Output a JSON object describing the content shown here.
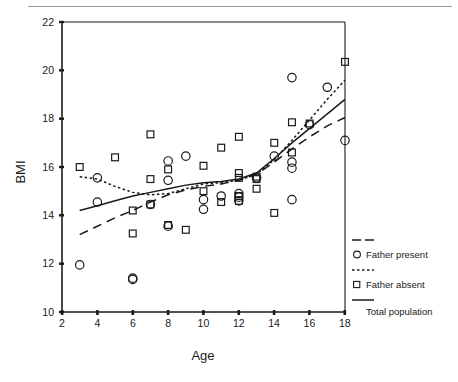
{
  "chart_data": {
    "type": "scatter",
    "title": "",
    "xlabel": "Age",
    "ylabel": "BMI",
    "xlim": [
      2,
      18
    ],
    "ylim": [
      10,
      22
    ],
    "xticks": [
      2,
      4,
      6,
      8,
      10,
      12,
      14,
      16,
      18
    ],
    "yticks": [
      10,
      12,
      14,
      16,
      18,
      20,
      22
    ],
    "grid": false,
    "legend_position": "right",
    "legend": [
      {
        "label": "Father present",
        "marker": "circle",
        "line": "dashed"
      },
      {
        "label": "Father absent",
        "marker": "square",
        "line": "dotted"
      },
      {
        "label": "Total population",
        "marker": "none",
        "line": "solid"
      }
    ],
    "series": [
      {
        "name": "Father present",
        "marker": "circle",
        "points": [
          [
            3,
            11.95
          ],
          [
            4,
            15.55
          ],
          [
            4,
            14.55
          ],
          [
            6,
            11.35
          ],
          [
            7,
            14.45
          ],
          [
            8,
            16.25
          ],
          [
            8,
            15.45
          ],
          [
            9,
            16.45
          ],
          [
            10,
            14.65
          ],
          [
            10,
            14.25
          ],
          [
            11,
            14.8
          ],
          [
            12,
            14.9
          ],
          [
            12,
            14.75
          ],
          [
            12,
            14.6
          ],
          [
            13,
            15.55
          ],
          [
            14,
            16.45
          ],
          [
            15,
            19.7
          ],
          [
            15,
            16.2
          ],
          [
            15,
            15.95
          ],
          [
            15,
            14.65
          ],
          [
            16,
            17.75
          ],
          [
            17,
            19.3
          ],
          [
            18,
            17.1
          ],
          [
            8,
            13.55
          ],
          [
            6,
            11.4
          ]
        ]
      },
      {
        "name": "Father absent",
        "marker": "square",
        "points": [
          [
            3,
            16.0
          ],
          [
            5,
            16.4
          ],
          [
            6,
            14.2
          ],
          [
            6,
            13.25
          ],
          [
            7,
            17.35
          ],
          [
            7,
            15.5
          ],
          [
            7,
            14.45
          ],
          [
            8,
            15.9
          ],
          [
            8,
            13.6
          ],
          [
            9,
            13.4
          ],
          [
            10,
            16.05
          ],
          [
            10,
            15.0
          ],
          [
            11,
            16.8
          ],
          [
            11,
            14.55
          ],
          [
            12,
            17.25
          ],
          [
            12,
            15.75
          ],
          [
            12,
            15.55
          ],
          [
            12,
            14.8
          ],
          [
            12,
            14.6
          ],
          [
            13,
            15.6
          ],
          [
            13,
            15.5
          ],
          [
            13,
            15.1
          ],
          [
            14,
            17.0
          ],
          [
            14,
            14.1
          ],
          [
            15,
            17.85
          ],
          [
            15,
            16.6
          ],
          [
            16,
            17.8
          ],
          [
            18,
            20.35
          ]
        ]
      }
    ],
    "fit_lines": [
      {
        "name": "Father present",
        "style": "dashed",
        "points": [
          [
            3,
            13.2
          ],
          [
            4,
            13.55
          ],
          [
            5,
            13.9
          ],
          [
            6,
            14.2
          ],
          [
            7,
            14.55
          ],
          [
            8,
            14.85
          ],
          [
            9,
            15.05
          ],
          [
            10,
            15.2
          ],
          [
            11,
            15.3
          ],
          [
            12,
            15.45
          ],
          [
            13,
            15.7
          ],
          [
            14,
            16.2
          ],
          [
            15,
            16.75
          ],
          [
            16,
            17.25
          ],
          [
            17,
            17.7
          ],
          [
            18,
            18.05
          ]
        ]
      },
      {
        "name": "Father absent",
        "style": "dotted",
        "points": [
          [
            3,
            15.6
          ],
          [
            4,
            15.5
          ],
          [
            5,
            15.2
          ],
          [
            6,
            14.95
          ],
          [
            7,
            14.85
          ],
          [
            8,
            14.9
          ],
          [
            9,
            15.1
          ],
          [
            10,
            15.3
          ],
          [
            11,
            15.35
          ],
          [
            12,
            15.45
          ],
          [
            13,
            15.7
          ],
          [
            14,
            16.3
          ],
          [
            15,
            17.1
          ],
          [
            16,
            17.95
          ],
          [
            17,
            18.8
          ],
          [
            18,
            19.6
          ]
        ]
      },
      {
        "name": "Total population",
        "style": "solid",
        "points": [
          [
            3,
            14.2
          ],
          [
            4,
            14.4
          ],
          [
            5,
            14.6
          ],
          [
            6,
            14.8
          ],
          [
            7,
            14.95
          ],
          [
            8,
            15.1
          ],
          [
            9,
            15.25
          ],
          [
            10,
            15.35
          ],
          [
            11,
            15.4
          ],
          [
            12,
            15.5
          ],
          [
            13,
            15.75
          ],
          [
            14,
            16.35
          ],
          [
            15,
            17.0
          ],
          [
            16,
            17.6
          ],
          [
            17,
            18.2
          ],
          [
            18,
            18.8
          ]
        ]
      }
    ]
  },
  "axes": {
    "y_label": "BMI",
    "x_label": "Age",
    "y_tick_labels": [
      "22",
      "20",
      "18",
      "16",
      "14",
      "12",
      "10"
    ],
    "x_tick_labels": [
      "2",
      "4",
      "6",
      "8",
      "10",
      "12",
      "14",
      "16",
      "18"
    ]
  },
  "legend_entries": {
    "father_present": "Father present",
    "father_absent": "Father absent",
    "total_population": "Total population"
  },
  "colors": {
    "ink": "#1a1a1a",
    "rule": "#9a9a9a",
    "background": "#ffffff"
  }
}
